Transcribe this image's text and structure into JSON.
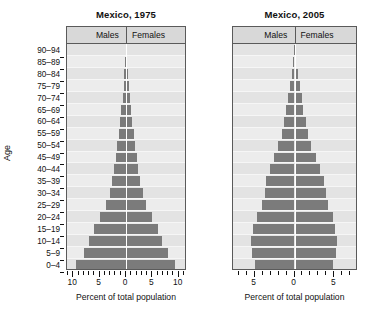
{
  "chart_data": {
    "type": "bar",
    "subtype": "population-pyramid",
    "categories": [
      "0–4",
      "5–9",
      "10–14",
      "15–19",
      "20–24",
      "25–29",
      "30–34",
      "35–39",
      "40–44",
      "45–49",
      "50–54",
      "55–59",
      "60–64",
      "65–69",
      "70–74",
      "75–79",
      "80–84",
      "85–89",
      "90–94"
    ],
    "ylabel": "Age",
    "xlabel": "Percent of total population",
    "grid": false,
    "legend_position": "panel-header",
    "panels": [
      {
        "title": "Mexico, 1975",
        "header_left": "Males",
        "header_right": "Females",
        "xlabel": "Percent of total population",
        "xlim": [
          -11.0,
          11.0
        ],
        "xticks_major": [
          10,
          5,
          0,
          5,
          10
        ],
        "xtick_minor_step": 1,
        "series": [
          {
            "name": "Males",
            "values": [
              9.4,
              7.9,
              6.9,
              6.0,
              4.8,
              3.7,
              3.0,
              2.6,
              2.2,
              1.9,
              1.6,
              1.3,
              1.1,
              0.85,
              0.65,
              0.45,
              0.28,
              0.15,
              0.06
            ]
          },
          {
            "name": "Females",
            "values": [
              9.2,
              7.8,
              6.8,
              5.9,
              4.9,
              3.8,
              3.1,
              2.7,
              2.3,
              2.0,
              1.7,
              1.4,
              1.2,
              0.95,
              0.72,
              0.5,
              0.32,
              0.18,
              0.07
            ]
          }
        ]
      },
      {
        "title": "Mexico, 2005",
        "header_left": "Males",
        "header_right": "Females",
        "xlabel": "Percent of total population",
        "xlim": [
          -7.6,
          7.6
        ],
        "xticks_major": [
          5,
          0,
          5
        ],
        "xtick_minor_step": 1,
        "series": [
          {
            "name": "Males",
            "values": [
              4.9,
              5.3,
              5.4,
              5.1,
              4.6,
              4.0,
              3.7,
              3.5,
              3.0,
              2.5,
              2.0,
              1.6,
              1.3,
              1.0,
              0.8,
              0.55,
              0.35,
              0.18,
              0.07
            ]
          },
          {
            "name": "Females",
            "values": [
              4.7,
              5.1,
              5.2,
              5.0,
              4.7,
              4.2,
              3.9,
              3.6,
              3.1,
              2.6,
              2.1,
              1.7,
              1.4,
              1.1,
              0.9,
              0.62,
              0.4,
              0.22,
              0.09
            ]
          }
        ]
      }
    ]
  },
  "colors": {
    "bar": "#7b7b7b",
    "panel_background": "#e9e9e9",
    "band_light": "#ececec",
    "band_dark": "#e3e3e3",
    "header_background": "#d8d8d8",
    "frame": "#5a5a5a",
    "center_line": "#ffffff",
    "text": "#111111"
  }
}
